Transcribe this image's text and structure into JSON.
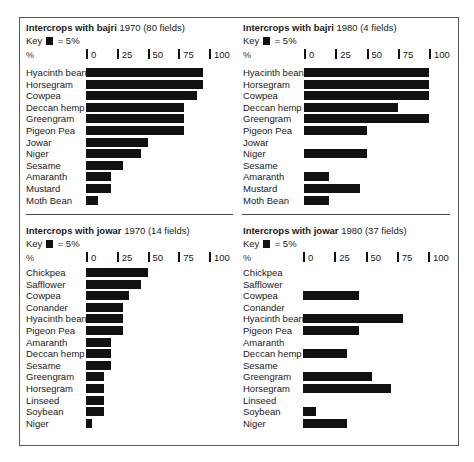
{
  "key": {
    "label": "Key",
    "equals": "= 5%"
  },
  "axis": {
    "unit_label": "%",
    "ticks": [
      "0",
      "25",
      "50",
      "75",
      "100"
    ]
  },
  "panels": [
    {
      "title_bold": "Intercrops with bajri",
      "title_rest": " 1970 (80 fields)",
      "rows": [
        {
          "label": "Hyacinth bean",
          "value": 95
        },
        {
          "label": "Horsegram",
          "value": 95
        },
        {
          "label": "Cowpea",
          "value": 90
        },
        {
          "label": "Deccan hemp",
          "value": 80
        },
        {
          "label": "Greengram",
          "value": 80
        },
        {
          "label": "Pigeon Pea",
          "value": 80
        },
        {
          "label": "Jowar",
          "value": 50
        },
        {
          "label": "Niger",
          "value": 45
        },
        {
          "label": "Sesame",
          "value": 30
        },
        {
          "label": "Amaranth",
          "value": 20
        },
        {
          "label": "Mustard",
          "value": 20
        },
        {
          "label": "Moth Bean",
          "value": 10
        }
      ]
    },
    {
      "title_bold": "Intercrops with bajri",
      "title_rest": " 1980 (4 fields)",
      "rows": [
        {
          "label": "Hyacinth bean",
          "value": 100
        },
        {
          "label": "Horsegram",
          "value": 100
        },
        {
          "label": "Cowpea",
          "value": 100
        },
        {
          "label": "Deccan hemp",
          "value": 75
        },
        {
          "label": "Greengram",
          "value": 100
        },
        {
          "label": "Pigeon Pea",
          "value": 50
        },
        {
          "label": "Jowar",
          "value": 0
        },
        {
          "label": "Niger",
          "value": 50
        },
        {
          "label": "Sesame",
          "value": 0
        },
        {
          "label": "Amaranth",
          "value": 20
        },
        {
          "label": "Mustard",
          "value": 45
        },
        {
          "label": "Moth Bean",
          "value": 20
        }
      ]
    },
    {
      "title_bold": "Intercrops with jowar",
      "title_rest": " 1970 (14 fields)",
      "rows": [
        {
          "label": "Chickpea",
          "value": 50
        },
        {
          "label": "Safflower",
          "value": 45
        },
        {
          "label": "Cowpea",
          "value": 35
        },
        {
          "label": "Conander",
          "value": 30
        },
        {
          "label": "Hyacinth bean",
          "value": 30
        },
        {
          "label": "Pigeon Pea",
          "value": 30
        },
        {
          "label": "Amaranth",
          "value": 20
        },
        {
          "label": "Deccan hemp",
          "value": 20
        },
        {
          "label": "Sesame",
          "value": 20
        },
        {
          "label": "Greengram",
          "value": 15
        },
        {
          "label": "Horsegram",
          "value": 15
        },
        {
          "label": "Linseed",
          "value": 15
        },
        {
          "label": "Soybean",
          "value": 15
        },
        {
          "label": "Niger",
          "value": 5
        }
      ]
    },
    {
      "title_bold": "Intercrops with jowar",
      "title_rest": " 1980 (37 fields)",
      "rows": [
        {
          "label": "Chickpea",
          "value": 0
        },
        {
          "label": "Safflower",
          "value": 0
        },
        {
          "label": "Cowpea",
          "value": 45
        },
        {
          "label": "Conander",
          "value": 0
        },
        {
          "label": "Hyacinth bean",
          "value": 80
        },
        {
          "label": "Pigeon Pea",
          "value": 45
        },
        {
          "label": "Amaranth",
          "value": 0
        },
        {
          "label": "Deccan hemp",
          "value": 35
        },
        {
          "label": "Sesame",
          "value": 0
        },
        {
          "label": "Greengram",
          "value": 55
        },
        {
          "label": "Horsegram",
          "value": 70
        },
        {
          "label": "Linseed",
          "value": 0
        },
        {
          "label": "Soybean",
          "value": 10
        },
        {
          "label": "Niger",
          "value": 35
        }
      ]
    }
  ],
  "chart_data": [
    {
      "type": "bar",
      "orientation": "horizontal",
      "title": "Intercrops with bajri 1970 (80 fields)",
      "annotation": "Key ■ = 5%",
      "xlabel": "%",
      "xticks": [
        0,
        25,
        50,
        75,
        100
      ],
      "xlim": [
        0,
        100
      ],
      "grid": false,
      "categories": [
        "Hyacinth bean",
        "Horsegram",
        "Cowpea",
        "Deccan hemp",
        "Greengram",
        "Pigeon Pea",
        "Jowar",
        "Niger",
        "Sesame",
        "Amaranth",
        "Mustard",
        "Moth Bean"
      ],
      "values": [
        95,
        95,
        90,
        80,
        80,
        80,
        50,
        45,
        30,
        20,
        20,
        10
      ]
    },
    {
      "type": "bar",
      "orientation": "horizontal",
      "title": "Intercrops with bajri 1980 (4 fields)",
      "annotation": "Key ■ = 5%",
      "xlabel": "%",
      "xticks": [
        0,
        25,
        50,
        75,
        100
      ],
      "xlim": [
        0,
        100
      ],
      "grid": false,
      "categories": [
        "Hyacinth bean",
        "Horsegram",
        "Cowpea",
        "Deccan hemp",
        "Greengram",
        "Pigeon Pea",
        "Jowar",
        "Niger",
        "Sesame",
        "Amaranth",
        "Mustard",
        "Moth Bean"
      ],
      "values": [
        100,
        100,
        100,
        75,
        100,
        50,
        0,
        50,
        0,
        20,
        45,
        20
      ]
    },
    {
      "type": "bar",
      "orientation": "horizontal",
      "title": "Intercrops with jowar 1970 (14 fields)",
      "annotation": "Key ■ = 5%",
      "xlabel": "%",
      "xticks": [
        0,
        25,
        50,
        75,
        100
      ],
      "xlim": [
        0,
        100
      ],
      "grid": false,
      "categories": [
        "Chickpea",
        "Safflower",
        "Cowpea",
        "Conander",
        "Hyacinth bean",
        "Pigeon Pea",
        "Amaranth",
        "Deccan hemp",
        "Sesame",
        "Greengram",
        "Horsegram",
        "Linseed",
        "Soybean",
        "Niger"
      ],
      "values": [
        50,
        45,
        35,
        30,
        30,
        30,
        20,
        20,
        20,
        15,
        15,
        15,
        15,
        5
      ]
    },
    {
      "type": "bar",
      "orientation": "horizontal",
      "title": "Intercrops with jowar 1980 (37 fields)",
      "annotation": "Key ■ = 5%",
      "xlabel": "%",
      "xticks": [
        0,
        25,
        50,
        75,
        100
      ],
      "xlim": [
        0,
        100
      ],
      "grid": false,
      "categories": [
        "Chickpea",
        "Safflower",
        "Cowpea",
        "Conander",
        "Hyacinth bean",
        "Pigeon Pea",
        "Amaranth",
        "Deccan hemp",
        "Sesame",
        "Greengram",
        "Horsegram",
        "Linseed",
        "Soybean",
        "Niger"
      ],
      "values": [
        0,
        0,
        45,
        0,
        80,
        45,
        0,
        35,
        0,
        55,
        70,
        0,
        10,
        35
      ]
    }
  ]
}
